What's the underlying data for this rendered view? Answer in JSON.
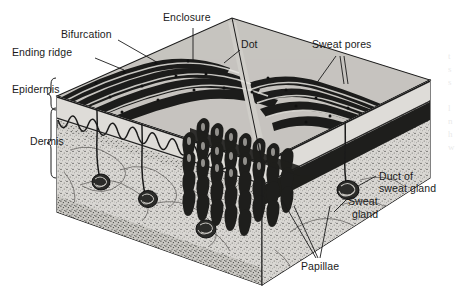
{
  "figure": {
    "type": "anatomical-illustration",
    "style": "black-and-white engraving / halftone",
    "background_color": "#ffffff",
    "ink_color": "#1b1b1b",
    "fill_light": "#d8d6d2",
    "fill_mid": "#9b9a96",
    "fill_dark": "#2a2a2a"
  },
  "labels": {
    "ending_ridge": "Ending ridge",
    "bifurcation": "Bifurcation",
    "enclosure": "Enclosure",
    "dot": "Dot",
    "sweat_pores": "Sweat pores",
    "epidermis": "Epidermis",
    "dermis": "Dermis",
    "duct_of_sweat_gland_line1": "Duct of",
    "duct_of_sweat_gland_line2": "sweat gland",
    "sweat_gland_line1": "Sweat",
    "sweat_gland_line2": "gland",
    "papillae": "Papillae"
  },
  "brackets": {
    "epidermis_label": "Epidermis",
    "dermis_label": "Dermis"
  },
  "side_text_fragment": "t\ns\ns\n\nl\nn\nh\nw"
}
